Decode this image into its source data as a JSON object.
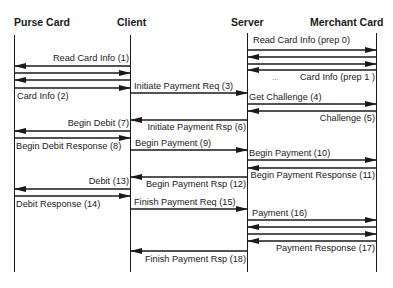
{
  "diagram": {
    "type": "sequence",
    "actors": [
      {
        "id": "purse",
        "label": "Purse Card"
      },
      {
        "id": "client",
        "label": "Client"
      },
      {
        "id": "server",
        "label": "Server"
      },
      {
        "id": "merchant",
        "label": "Merchant Card"
      }
    ],
    "messages": [
      {
        "from": "server",
        "to": "merchant",
        "label": "Read Card Info (prep 0)"
      },
      {
        "from": "merchant",
        "to": "server",
        "label": ""
      },
      {
        "from": "server",
        "to": "merchant",
        "label": ""
      },
      {
        "from": "merchant",
        "to": "server",
        "label": "Card Info (prep 1 )"
      },
      {
        "ellipsis": "..."
      },
      {
        "from": "client",
        "to": "purse",
        "label": "Read Card Info (1)"
      },
      {
        "from": "purse",
        "to": "client",
        "label": ""
      },
      {
        "from": "client",
        "to": "purse",
        "label": ""
      },
      {
        "from": "purse",
        "to": "client",
        "label": "Card Info (2)"
      },
      {
        "from": "client",
        "to": "server",
        "label": "Initiate Payment Req (3)"
      },
      {
        "from": "server",
        "to": "merchant",
        "label": "Get Challenge (4)"
      },
      {
        "from": "merchant",
        "to": "server",
        "label": "Challenge (5)"
      },
      {
        "from": "server",
        "to": "client",
        "label": "Initiate Payment Rsp (6)"
      },
      {
        "from": "client",
        "to": "purse",
        "label": "Begin Debit (7)"
      },
      {
        "from": "purse",
        "to": "client",
        "label": "Begin Debit Response (8)"
      },
      {
        "from": "client",
        "to": "server",
        "label": "Begin Payment (9)"
      },
      {
        "from": "server",
        "to": "merchant",
        "label": "Begin Payment (10)"
      },
      {
        "from": "merchant",
        "to": "server",
        "label": "Begin Payment Response (11)"
      },
      {
        "from": "server",
        "to": "client",
        "label": "Begin Payment Rsp (12)"
      },
      {
        "from": "client",
        "to": "purse",
        "label": "Debit (13)"
      },
      {
        "from": "purse",
        "to": "client",
        "label": "Debit Response (14)"
      },
      {
        "from": "client",
        "to": "server",
        "label": "Finish Payment Req (15)"
      },
      {
        "from": "server",
        "to": "merchant",
        "label": "Payment (16)"
      },
      {
        "from": "merchant",
        "to": "server",
        "label": ""
      },
      {
        "from": "server",
        "to": "merchant",
        "label": ""
      },
      {
        "from": "merchant",
        "to": "server",
        "label": "Payment Response (17)"
      },
      {
        "from": "server",
        "to": "client",
        "label": "Finish Payment Rsp (18)"
      }
    ]
  },
  "labels": {
    "prep0": "Read Card Info (prep 0)",
    "prep1": "Card Info (prep 1 )",
    "ellipsis": "...",
    "m1": "Read Card Info (1)",
    "m2": "Card Info (2)",
    "m3": "Initiate Payment Req (3)",
    "m4": "Get Challenge (4)",
    "m5": "Challenge (5)",
    "m6": "Initiate Payment Rsp (6)",
    "m7": "Begin Debit (7)",
    "m8": "Begin Debit Response (8)",
    "m9": "Begin Payment (9)",
    "m10": "Begin Payment (10)",
    "m11": "Begin Payment Response (11)",
    "m12": "Begin Payment Rsp (12)",
    "m13": "Debit (13)",
    "m14": "Debit Response (14)",
    "m15": "Finish Payment Req (15)",
    "m16": "Payment (16)",
    "m17": "Payment Response (17)",
    "m18": "Finish Payment Rsp (18)"
  },
  "colors": {
    "line": "#1a1a1a",
    "background": "#ffffff"
  }
}
